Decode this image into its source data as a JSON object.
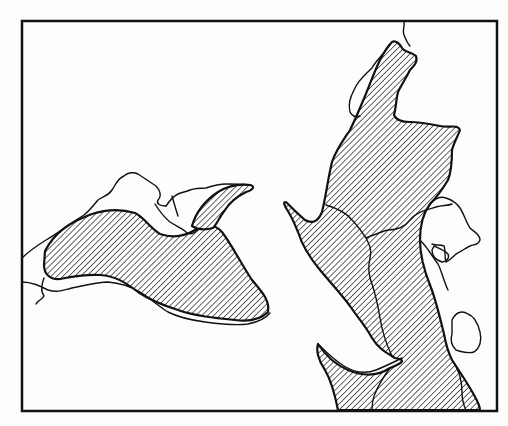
{
  "map": {
    "width": 508,
    "height": 426,
    "colors": {
      "background": "#fdfdfd",
      "ink": "#111111",
      "hatch_fill": "#ffffff"
    },
    "frame": {
      "x": 22,
      "y": 21,
      "width": 475,
      "height": 390,
      "stroke_width": 2.5
    },
    "hatch": {
      "spacing": 4.2,
      "angle": 45,
      "stroke_width": 1.3
    },
    "hatched_regions": [
      {
        "name": "west-basin",
        "d": "M45,251 C55,232 70,222 92,214 C110,208 125,210 135,213 C145,218 150,228 160,234 C172,238 185,236 195,230 C205,224 215,224 222,232 C232,245 240,262 252,280 C262,292 270,300 268,312 C260,320 250,322 235,320 C215,318 195,316 178,310 C162,305 150,300 138,292 C125,282 115,276 100,275 C85,274 70,277 60,279 C50,280 44,274 44,265 Z"
      },
      {
        "name": "north-gulf-arm",
        "d": "M192,226 C196,212 206,200 218,192 C228,186 240,184 250,185 C255,186 254,190 246,192 C238,196 230,202 225,210 C220,216 217,224 213,228 C206,230 198,230 192,226 Z"
      },
      {
        "name": "eastern-trough",
        "d": "M338,410 C335,395 332,382 325,370 C318,360 316,350 318,344 C326,356 336,365 348,370 C360,375 375,378 390,368 C405,362 405,360 395,358 C385,352 378,348 372,338 C365,325 358,318 350,306 C342,295 330,282 320,270 C310,258 302,245 298,232 C294,222 290,214 286,208 C284,204 283,202 286,202 C292,208 298,214 305,220 C312,224 318,222 322,212 C326,196 328,178 332,162 C336,150 342,142 350,130 C356,118 360,108 365,96 C370,84 375,70 380,60 C384,52 388,46 392,42 C396,40 400,44 402,48 C404,52 412,52 416,56 C418,62 414,66 410,70 C406,78 402,84 398,92 C396,100 396,108 394,115 C396,120 402,122 410,122 C420,122 430,124 440,126 C450,128 458,124 460,130 C458,136 454,142 452,150 C452,160 452,170 448,180 C442,190 436,198 430,204 C424,212 420,222 420,240 C420,256 424,270 430,285 C436,300 440,318 444,334 C446,345 448,352 452,360 C460,372 468,384 474,395 C478,402 480,408 480,410 Z"
      }
    ],
    "outline_paths": [
      {
        "name": "west-outer-coast",
        "d": "M22,258 C30,250 38,245 46,240 C60,232 72,222 84,215 C90,210 94,205 98,200 C104,196 108,196 112,190 C116,184 118,178 124,176 C128,172 134,172 138,174 C144,178 150,182 156,186 C160,190 162,196 158,200 C156,204 160,206 166,206"
      },
      {
        "name": "west-south-shore",
        "d": "M22,282 C32,282 40,286 48,290 C58,293 64,290 72,288 C84,286 96,282 108,282 C120,283 130,286 140,292 C150,298 158,306 168,312 C178,317 190,320 205,322 C220,324 235,326 248,324 C258,322 266,318 270,313"
      },
      {
        "name": "west-river-stub",
        "d": "M44,278 C42,284 40,290 44,296 C42,300 38,300 36,304"
      },
      {
        "name": "north-coast-ridge",
        "d": "M166,206 C170,200 174,196 178,194 C182,192 186,192 190,190 C196,188 200,188 206,188 C212,186 218,184 226,184 C234,184 240,184 250,185"
      },
      {
        "name": "inlet-loop",
        "d": "M155,204 C160,212 165,218 170,222 C176,226 182,228 186,232 C190,236 196,232 200,228"
      },
      {
        "name": "inner-spur",
        "d": "M172,196 C174,203 176,210 178,216"
      },
      {
        "name": "north-river",
        "d": "M404,21 C405,26 402,30 404,35 C406,40 408,44 410,46"
      },
      {
        "name": "northwest-ridge-coast",
        "d": "M392,42 C386,52 376,60 372,68 C366,74 358,80 354,90 C350,98 348,104 350,112 C352,116 356,118 360,116"
      },
      {
        "name": "interior-divide-west",
        "d": "M326,205 C336,208 346,212 352,220 C358,226 362,232 366,238 C370,246 372,250 370,258 C368,266 368,274 372,284 C376,296 378,306 380,318 C382,330 386,344 392,356"
      },
      {
        "name": "interior-divide-north",
        "d": "M366,238 C374,235 380,232 388,230 C396,230 404,228 410,220 C416,212 426,210 436,207 C442,205 448,206 452,204"
      },
      {
        "name": "east-lakes-upper",
        "d": "M430,204 C436,198 440,196 446,198 C452,200 456,202 460,208 C464,214 466,222 470,228 C474,232 480,234 480,240 C478,246 474,244 470,246 C466,248 460,252 456,254 C452,258 450,260 446,262 C444,256 446,250 444,246 C440,244 436,246 432,244"
      },
      {
        "name": "east-lake-small",
        "d": "M434,246 C438,248 444,250 448,254 C450,258 446,262 442,262 C436,260 432,256 432,250 Z"
      },
      {
        "name": "east-coast-lower",
        "d": "M420,240 C428,248 432,256 438,264 C442,272 444,282 448,290"
      },
      {
        "name": "east-lake-lower",
        "d": "M452,320 C456,312 462,310 468,314 C474,316 478,324 480,332 C482,340 480,348 474,352 C468,354 462,352 456,350 C452,346 450,340 452,334 Z"
      },
      {
        "name": "southwest-spit-edge",
        "d": "M318,344 C326,352 334,360 344,366 C354,372 366,374 376,370 C386,366 394,362 402,358"
      },
      {
        "name": "lower-valley-line",
        "d": "M390,368 C384,376 378,386 374,396 C372,402 372,406 372,410"
      },
      {
        "name": "southeast-inner-line",
        "d": "M452,360 C458,368 462,380 462,392 C462,400 464,406 466,410"
      }
    ]
  }
}
